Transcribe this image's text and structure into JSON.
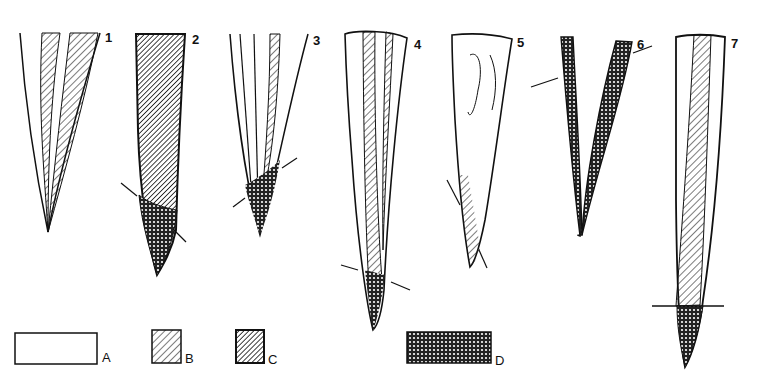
{
  "figure": {
    "items": [
      {
        "number": "1"
      },
      {
        "number": "2"
      },
      {
        "number": "3"
      },
      {
        "number": "4"
      },
      {
        "number": "5"
      },
      {
        "number": "6"
      },
      {
        "number": "7"
      }
    ],
    "legend": [
      {
        "key": "A",
        "pattern": "blank"
      },
      {
        "key": "B",
        "pattern": "light-hatch"
      },
      {
        "key": "C",
        "pattern": "dense-hatch"
      },
      {
        "key": "D",
        "pattern": "cross-hatch"
      }
    ],
    "colors": {
      "ink": "#111111",
      "paper": "#ffffff"
    }
  }
}
